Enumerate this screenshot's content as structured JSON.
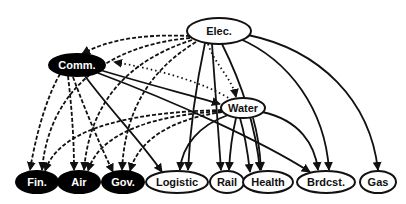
{
  "diagram": {
    "type": "directed-dependency-graph",
    "nodes": [
      {
        "id": "elec",
        "label": "Elec.",
        "style": "hollow",
        "cx": 219,
        "cy": 31,
        "rx": 32,
        "ry": 13
      },
      {
        "id": "comm",
        "label": "Comm.",
        "style": "filled",
        "cx": 77,
        "cy": 65,
        "rx": 28,
        "ry": 11
      },
      {
        "id": "water",
        "label": "Water",
        "style": "hollow",
        "cx": 243,
        "cy": 108,
        "rx": 22,
        "ry": 10
      },
      {
        "id": "fin",
        "label": "Fin.",
        "style": "filled",
        "cx": 37,
        "cy": 182,
        "rx": 21,
        "ry": 11
      },
      {
        "id": "air",
        "label": "Air",
        "style": "filled",
        "cx": 79,
        "cy": 182,
        "rx": 21,
        "ry": 11
      },
      {
        "id": "gov",
        "label": "Gov.",
        "style": "filled",
        "cx": 123,
        "cy": 182,
        "rx": 21,
        "ry": 11
      },
      {
        "id": "logistic",
        "label": "Logistic",
        "style": "hollow",
        "cx": 177,
        "cy": 182,
        "rx": 31,
        "ry": 11
      },
      {
        "id": "rail",
        "label": "Rail",
        "style": "hollow",
        "cx": 227,
        "cy": 182,
        "rx": 17,
        "ry": 11
      },
      {
        "id": "health",
        "label": "Health",
        "style": "hollow",
        "cx": 268,
        "cy": 182,
        "rx": 25,
        "ry": 11
      },
      {
        "id": "brdcst",
        "label": "Brdcst.",
        "style": "hollow",
        "cx": 326,
        "cy": 182,
        "rx": 29,
        "ry": 11
      },
      {
        "id": "gas",
        "label": "Gas",
        "style": "hollow",
        "cx": 378,
        "cy": 182,
        "rx": 18,
        "ry": 11
      }
    ],
    "edges": [
      {
        "from": "elec",
        "to": "comm",
        "style": "dashed"
      },
      {
        "from": "elec",
        "to": "fin",
        "style": "dashed"
      },
      {
        "from": "elec",
        "to": "air",
        "style": "dashed"
      },
      {
        "from": "elec",
        "to": "gov",
        "style": "dashed"
      },
      {
        "from": "elec",
        "to": "water",
        "style": "dotted"
      },
      {
        "from": "water",
        "to": "comm",
        "style": "dotted"
      },
      {
        "from": "elec",
        "to": "logistic",
        "style": "solid"
      },
      {
        "from": "elec",
        "to": "rail",
        "style": "solid"
      },
      {
        "from": "elec",
        "to": "health",
        "style": "solid"
      },
      {
        "from": "elec",
        "to": "brdcst",
        "style": "solid"
      },
      {
        "from": "elec",
        "to": "gas",
        "style": "solid"
      },
      {
        "from": "comm",
        "to": "water",
        "style": "solid"
      },
      {
        "from": "comm",
        "to": "logistic",
        "style": "solid"
      },
      {
        "from": "comm",
        "to": "brdcst",
        "style": "solid"
      },
      {
        "from": "comm",
        "to": "fin",
        "style": "dashed"
      },
      {
        "from": "comm",
        "to": "air",
        "style": "dashed"
      },
      {
        "from": "comm",
        "to": "gov",
        "style": "dashed"
      },
      {
        "from": "water",
        "to": "fin",
        "style": "dashed"
      },
      {
        "from": "water",
        "to": "air",
        "style": "dashed"
      },
      {
        "from": "water",
        "to": "gov",
        "style": "dashed"
      },
      {
        "from": "water",
        "to": "logistic",
        "style": "solid"
      },
      {
        "from": "water",
        "to": "rail",
        "style": "solid"
      },
      {
        "from": "water",
        "to": "health",
        "style": "solid"
      },
      {
        "from": "water",
        "to": "brdcst",
        "style": "solid"
      }
    ],
    "colors": {
      "line": "#111111",
      "filled_node": "#000000",
      "filled_text": "#ffffff",
      "hollow_node": "#ffffff",
      "hollow_text": "#111111",
      "background": "#ffffff"
    }
  }
}
